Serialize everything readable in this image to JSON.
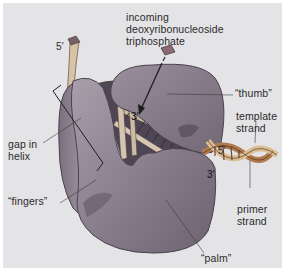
{
  "figure": {
    "colors": {
      "background": "#e4e3e6",
      "protein": "#8a7f8c",
      "protein_shadow": "#5e5563",
      "protein_light": "#a79daa",
      "dna_strand_front": "#d9b98f",
      "dna_strand_back": "#b07a4c",
      "dna_base_pair": "#6b4a36",
      "nucleotide": "#8b6a72",
      "label_text": "#2b2b2b",
      "leader_line": "#3a3a3a"
    },
    "labels": {
      "incoming_line1": "incoming",
      "incoming_line2": "deoxyribonucleoside",
      "incoming_line3": "triphosphate",
      "five_prime_top": "5′",
      "thumb": "“thumb”",
      "template_line1": "template",
      "template_line2": "strand",
      "three_prime_active": "3′",
      "gap_line1": "gap in",
      "gap_line2": "helix",
      "five_prime_helix": "5′",
      "three_prime_helix": "3′",
      "fingers": "“fingers”",
      "primer_line1": "primer",
      "primer_line2": "strand",
      "palm": "“palm”"
    }
  }
}
